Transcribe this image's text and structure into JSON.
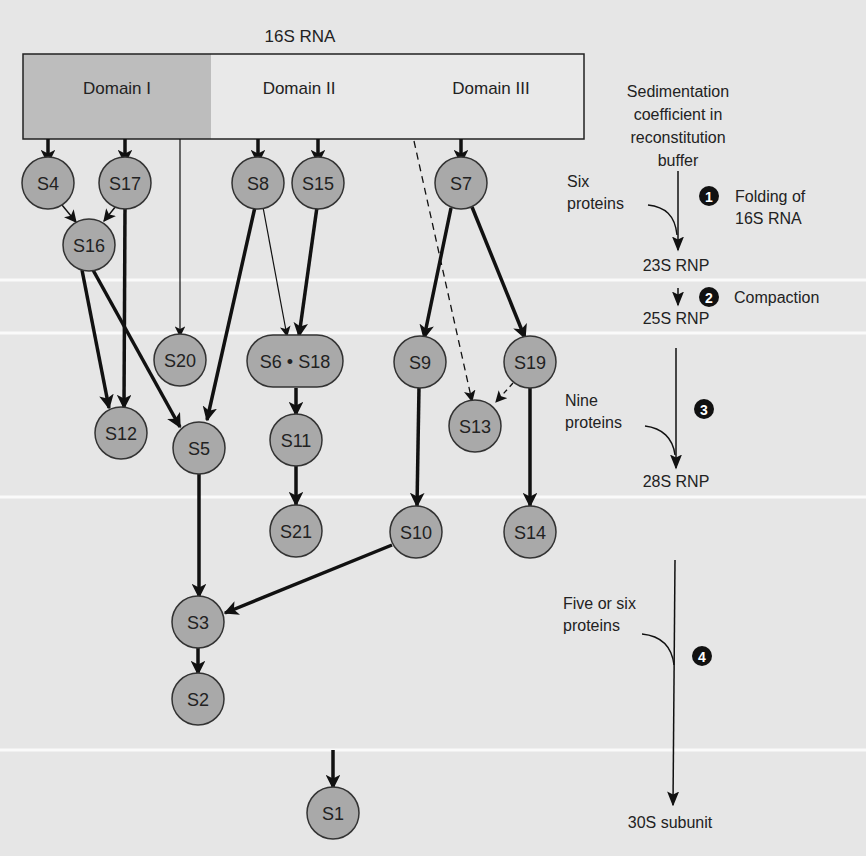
{
  "colors": {
    "background": "#e6e6e6",
    "band_line": "#fafafa",
    "node_fill": "#a9a9a9",
    "node_stroke": "#333333",
    "domain1_fill": "#bdbdbd",
    "domain_rest_fill": "#e9e9e9",
    "arrow": "#111111",
    "step_badge": "#111111"
  },
  "rna": {
    "title": "16S RNA",
    "domains": [
      {
        "label": "Domain I"
      },
      {
        "label": "Domain II"
      },
      {
        "label": "Domain III"
      }
    ]
  },
  "nodes": [
    {
      "id": "S4",
      "label": "S4",
      "x": 48,
      "y": 183
    },
    {
      "id": "S17",
      "label": "S17",
      "x": 125,
      "y": 183
    },
    {
      "id": "S16",
      "label": "S16",
      "x": 89,
      "y": 245
    },
    {
      "id": "S8",
      "label": "S8",
      "x": 258,
      "y": 183
    },
    {
      "id": "S15",
      "label": "S15",
      "x": 318,
      "y": 183
    },
    {
      "id": "S7",
      "label": "S7",
      "x": 461,
      "y": 183
    },
    {
      "id": "S20",
      "label": "S20",
      "x": 180,
      "y": 360
    },
    {
      "id": "S6S18",
      "label": "S6 • S18",
      "x": 295,
      "y": 361,
      "pill": true
    },
    {
      "id": "S9",
      "label": "S9",
      "x": 420,
      "y": 362
    },
    {
      "id": "S19",
      "label": "S19",
      "x": 530,
      "y": 362
    },
    {
      "id": "S12",
      "label": "S12",
      "x": 121,
      "y": 433
    },
    {
      "id": "S5",
      "label": "S5",
      "x": 199,
      "y": 448
    },
    {
      "id": "S11",
      "label": "S11",
      "x": 296,
      "y": 440
    },
    {
      "id": "S13",
      "label": "S13",
      "x": 475,
      "y": 426
    },
    {
      "id": "S21",
      "label": "S21",
      "x": 296,
      "y": 531
    },
    {
      "id": "S10",
      "label": "S10",
      "x": 416,
      "y": 532
    },
    {
      "id": "S14",
      "label": "S14",
      "x": 530,
      "y": 532
    },
    {
      "id": "S3",
      "label": "S3",
      "x": 198,
      "y": 622
    },
    {
      "id": "S2",
      "label": "S2",
      "x": 198,
      "y": 699
    },
    {
      "id": "S1",
      "label": "S1",
      "x": 333,
      "y": 813
    }
  ],
  "sidebar": {
    "heading_lines": [
      "Sedimentation",
      "coefficient in",
      "reconstitution",
      "buffer"
    ],
    "steps": [
      {
        "number": "1",
        "description_lines": [
          "Folding of",
          "16S RNA"
        ],
        "proteins_lines": [
          "Six",
          "proteins"
        ]
      },
      {
        "number": "2",
        "description_lines": [
          "Compaction"
        ],
        "proteins_lines": []
      },
      {
        "number": "3",
        "description_lines": [],
        "proteins_lines": [
          "Nine",
          "proteins"
        ]
      },
      {
        "number": "4",
        "description_lines": [],
        "proteins_lines": [
          "Five or six",
          "proteins"
        ]
      }
    ],
    "stages": [
      "23S RNP",
      "25S RNP",
      "28S RNP",
      "30S subunit"
    ]
  }
}
